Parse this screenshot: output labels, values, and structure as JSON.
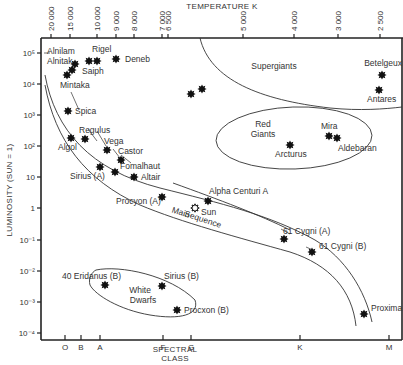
{
  "chart_data": {
    "type": "scatter",
    "top_axis": {
      "label": "TEMPERATURE K",
      "ticks": [
        {
          "label": "20 000",
          "x": 51
        },
        {
          "label": "15 000",
          "x": 70
        },
        {
          "label": "10 000",
          "x": 97
        },
        {
          "label": "9 000",
          "x": 116
        },
        {
          "label": "8 000",
          "x": 134
        },
        {
          "label": "7 000",
          "x": 162
        },
        {
          "label": "6 500",
          "x": 168
        },
        {
          "label": "5 000",
          "x": 243
        },
        {
          "label": "4 000",
          "x": 294
        },
        {
          "label": "3 000",
          "x": 338
        },
        {
          "label": "2 500",
          "x": 380
        }
      ]
    },
    "y_axis": {
      "label": "LUMINOSITY (SUN = 1)",
      "scale": "log",
      "ylim": [
        0.0001,
        100000
      ],
      "ticks": [
        {
          "label": "10⁵",
          "value": 100000,
          "y": 53
        },
        {
          "label": "10⁴",
          "value": 10000,
          "y": 84
        },
        {
          "label": "10³",
          "value": 1000,
          "y": 115
        },
        {
          "label": "10²",
          "value": 100,
          "y": 146
        },
        {
          "label": "10",
          "value": 10,
          "y": 177
        },
        {
          "label": "1",
          "value": 1,
          "y": 208
        },
        {
          "label": "10⁻¹",
          "value": 0.1,
          "y": 240
        },
        {
          "label": "10⁻²",
          "value": 0.01,
          "y": 271
        },
        {
          "label": "10⁻³",
          "value": 0.001,
          "y": 302
        },
        {
          "label": "10⁻⁴",
          "value": 0.0001,
          "y": 333
        }
      ]
    },
    "x_axis": {
      "label_line1": "SPECTRAL",
      "label_line2": "CLASS",
      "ticks": [
        {
          "label": "O",
          "x": 65
        },
        {
          "label": "B",
          "x": 81
        },
        {
          "label": "A",
          "x": 100
        },
        {
          "label": "F",
          "x": 163
        },
        {
          "label": "G",
          "x": 191
        },
        {
          "label": "K",
          "x": 300
        },
        {
          "label": "M",
          "x": 389
        }
      ]
    },
    "regions": [
      {
        "name": "Supergiants",
        "x": 274,
        "y": 69
      },
      {
        "name": "Red",
        "x": 263,
        "y": 127
      },
      {
        "name": "Giants",
        "x": 263,
        "y": 137
      },
      {
        "name": "White",
        "x": 140,
        "y": 293
      },
      {
        "name": "Dwarfs",
        "x": 143,
        "y": 303
      },
      {
        "name": "Main",
        "x": 180,
        "y": 215
      },
      {
        "name": "Sequence",
        "x": 202,
        "y": 222
      }
    ],
    "stars": [
      {
        "name": "Alnilam",
        "class": "B0",
        "luminosity": 100000,
        "sx": 75,
        "sy": 64,
        "lx": 47,
        "ly": 54,
        "anchor": "start"
      },
      {
        "name": "Alnitak",
        "class": "O9",
        "luminosity": 60000,
        "sx": 72,
        "sy": 70,
        "lx": 47,
        "ly": 64,
        "anchor": "start"
      },
      {
        "name": "Mintaka",
        "class": "O9",
        "luminosity": 20000,
        "sx": 67,
        "sy": 75,
        "lx": 60,
        "ly": 88,
        "anchor": "start"
      },
      {
        "name": "Rigel",
        "class": "B8",
        "luminosity": 50000,
        "sx": 89,
        "sy": 61,
        "lx": 92,
        "ly": 52,
        "anchor": "start"
      },
      {
        "name": "Saiph",
        "class": "B0",
        "luminosity": 50000,
        "sx": 97,
        "sy": 61,
        "lx": 82,
        "ly": 74,
        "anchor": "start"
      },
      {
        "name": "Deneb",
        "class": "A2",
        "luminosity": 60000,
        "sx": 116,
        "sy": 59,
        "lx": 125,
        "ly": 62,
        "anchor": "start"
      },
      {
        "name": "Spica",
        "class": "B1",
        "luminosity": 2000,
        "sx": 68,
        "sy": 111,
        "lx": 75,
        "ly": 114,
        "anchor": "start"
      },
      {
        "name": "Regulus",
        "class": "B7",
        "luminosity": 150,
        "sx": 85,
        "sy": 139,
        "lx": 79,
        "ly": 133,
        "anchor": "start"
      },
      {
        "name": "Algol",
        "class": "B8",
        "luminosity": 150,
        "sx": 71,
        "sy": 138,
        "lx": 58,
        "ly": 150,
        "anchor": "start"
      },
      {
        "name": "Vega",
        "class": "A0",
        "luminosity": 60,
        "sx": 107,
        "sy": 150,
        "lx": 104,
        "ly": 144,
        "anchor": "start"
      },
      {
        "name": "Castor",
        "class": "A1",
        "luminosity": 30,
        "sx": 121,
        "sy": 160,
        "lx": 118,
        "ly": 154,
        "anchor": "start"
      },
      {
        "name": "Sirius (A)",
        "class": "A1",
        "luminosity": 23,
        "sx": 100,
        "sy": 167,
        "lx": 70,
        "ly": 179,
        "anchor": "start"
      },
      {
        "name": "Fomalhaut",
        "class": "A3",
        "luminosity": 15,
        "sx": 115,
        "sy": 172,
        "lx": 120,
        "ly": 169,
        "anchor": "start"
      },
      {
        "name": "Altair",
        "class": "A7",
        "luminosity": 10,
        "sx": 134,
        "sy": 177,
        "lx": 141,
        "ly": 180,
        "anchor": "start"
      },
      {
        "name": "Procyon (A)",
        "class": "F5",
        "luminosity": 7,
        "sx": 162,
        "sy": 197,
        "lx": 116,
        "ly": 204,
        "anchor": "start"
      },
      {
        "name": "Sun",
        "class": "G2",
        "luminosity": 1,
        "sx": 195,
        "sy": 208,
        "lx": 201,
        "ly": 215,
        "anchor": "start",
        "open": true
      },
      {
        "name": "Alpha Centuri A",
        "class": "G2",
        "luminosity": 1.5,
        "sx": 208,
        "sy": 201,
        "lx": 209,
        "ly": 194,
        "anchor": "start"
      },
      {
        "name": "",
        "class": "G",
        "luminosity": 5000,
        "sx": 191,
        "sy": 94,
        "lx": 0,
        "ly": 0,
        "anchor": "start"
      },
      {
        "name": "",
        "class": "G",
        "luminosity": 7000,
        "sx": 202,
        "sy": 89,
        "lx": 0,
        "ly": 0,
        "anchor": "start"
      },
      {
        "name": "Betelgeux",
        "class": "M2",
        "luminosity": 20000,
        "sx": 382,
        "sy": 75,
        "lx": 402,
        "ly": 66,
        "anchor": "end"
      },
      {
        "name": "Antares",
        "class": "M1",
        "luminosity": 6000,
        "sx": 379,
        "sy": 90,
        "lx": 367,
        "ly": 102,
        "anchor": "start"
      },
      {
        "name": "Mira",
        "class": "M6",
        "luminosity": 250,
        "sx": 329,
        "sy": 136,
        "lx": 321,
        "ly": 129,
        "anchor": "start"
      },
      {
        "name": "Aldebaran",
        "class": "K5",
        "luminosity": 150,
        "sx": 337,
        "sy": 138,
        "lx": 338,
        "ly": 151,
        "anchor": "start"
      },
      {
        "name": "Arcturus",
        "class": "K1",
        "luminosity": 100,
        "sx": 290,
        "sy": 145,
        "lx": 275,
        "ly": 157,
        "anchor": "start"
      },
      {
        "name": "61 Cygni (A)",
        "class": "K5",
        "luminosity": 0.1,
        "sx": 284,
        "sy": 239,
        "lx": 283,
        "ly": 234,
        "anchor": "start"
      },
      {
        "name": "61 Cygni (B)",
        "class": "K7",
        "luminosity": 0.05,
        "sx": 312,
        "sy": 252,
        "lx": 319,
        "ly": 249,
        "anchor": "start"
      },
      {
        "name": "Proxima",
        "class": "M5",
        "luminosity": 0.0005,
        "sx": 364,
        "sy": 314,
        "lx": 371,
        "ly": 311,
        "anchor": "start"
      },
      {
        "name": "40 Eridanus (B)",
        "class": "A",
        "luminosity": 0.004,
        "sx": 105,
        "sy": 285,
        "lx": 62,
        "ly": 279,
        "anchor": "start"
      },
      {
        "name": "Sirius (B)",
        "class": "F",
        "luminosity": 0.004,
        "sx": 162,
        "sy": 286,
        "lx": 164,
        "ly": 279,
        "anchor": "start"
      },
      {
        "name": "Procxon (B)",
        "class": "G",
        "luminosity": 0.0005,
        "sx": 177,
        "sy": 310,
        "lx": 184,
        "ly": 313,
        "anchor": "start"
      }
    ],
    "grid": false,
    "legend": null
  }
}
